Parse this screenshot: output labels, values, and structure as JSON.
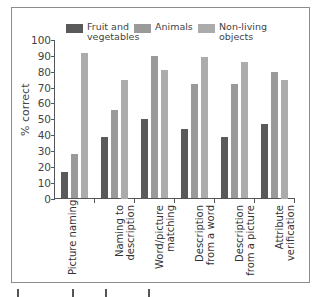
{
  "chart_data": {
    "type": "bar",
    "title": "",
    "xlabel": "",
    "ylabel": "% correct",
    "ylim": [
      0,
      100
    ],
    "yticks": [
      0,
      10,
      20,
      30,
      40,
      50,
      60,
      70,
      80,
      90,
      100
    ],
    "grid": false,
    "legend_position": "top",
    "categories": [
      "Picture naming",
      "Naming to description",
      "Word/picture matching",
      "Description from a word",
      "Description from a picture",
      "Attribute verification"
    ],
    "series": [
      {
        "name": "Fruit and vegetables",
        "color": "#5a5a5a",
        "values": [
          17,
          39,
          50,
          44,
          39,
          47
        ]
      },
      {
        "name": "Animals",
        "color": "#9a9a9a",
        "values": [
          28,
          56,
          90,
          72,
          72,
          80
        ]
      },
      {
        "name": "Non-living objects",
        "color": "#ababab",
        "values": [
          92,
          75,
          81,
          89,
          86,
          75
        ]
      }
    ]
  },
  "legend": {
    "items": [
      {
        "label_line1": "Fruit and",
        "label_line2": "vegetables",
        "color": "#5a5a5a"
      },
      {
        "label_line1": "Animals",
        "label_line2": "",
        "color": "#9a9a9a"
      },
      {
        "label_line1": "Non-living",
        "label_line2": "objects",
        "color": "#ababab"
      }
    ]
  },
  "axis": {
    "y_title": "% correct",
    "y_tick_labels": [
      "0",
      "10",
      "20",
      "30",
      "40",
      "50",
      "60",
      "70",
      "80",
      "90",
      "100"
    ]
  },
  "x_labels": [
    {
      "line1": "Picture naming",
      "line2": ""
    },
    {
      "line1": "Naming to",
      "line2": "description"
    },
    {
      "line1": "Word/picture",
      "line2": "matching"
    },
    {
      "line1": "Description",
      "line2": "from a word"
    },
    {
      "line1": "Description",
      "line2": "from a picture"
    },
    {
      "line1": "Attribute",
      "line2": "verification"
    }
  ]
}
